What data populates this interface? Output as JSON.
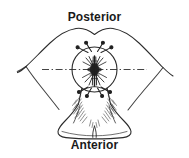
{
  "figure": {
    "type": "anatomical-line-drawing",
    "orientation_labels": {
      "top": "Posterior",
      "bottom": "Anterior"
    },
    "colors": {
      "background": "#ffffff",
      "ink": "#1a1a1a",
      "label_text": "#1a1a1a",
      "outline": "#333333",
      "hatching": "#4a4a4a",
      "centerline": "#3a3a3a"
    },
    "elements": {
      "circle_label": "region-of-interest-circle",
      "centerline_label": "horizontal-center-line",
      "radiating_label": "radiating-nerve-bundle",
      "upper_markers_label": "upper-arrow-markers",
      "lower_markers_label": "lower-arrow-markers",
      "lateral_wings_label": "lateral-wing-outlines",
      "anterior_bulb_label": "anterior-bulb-outline"
    },
    "counts": {
      "upper_markers": 4,
      "lower_markers": 4
    }
  }
}
